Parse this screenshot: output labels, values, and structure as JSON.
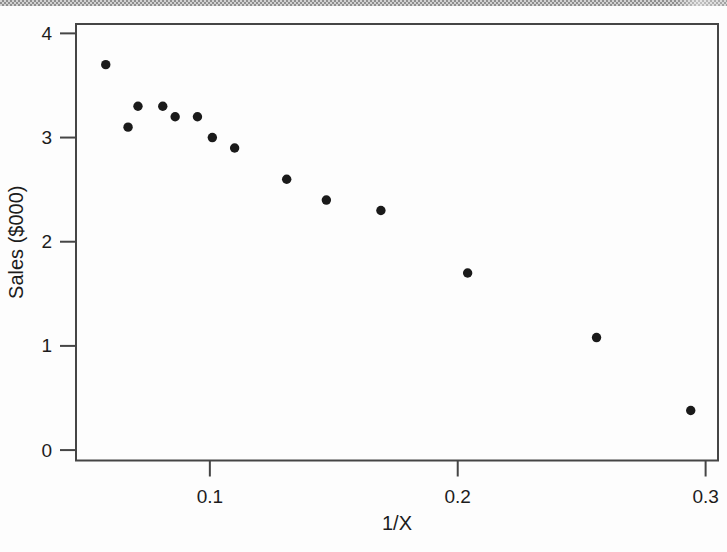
{
  "page": {
    "background_color": "#fdfdfd",
    "top_bar_color": "#a9a9a9"
  },
  "chart_data": {
    "type": "scatter",
    "title": "",
    "xlabel": "1/X",
    "ylabel": "Sales ($000)",
    "xlim": [
      0.046,
      0.305
    ],
    "ylim": [
      -0.1,
      4.09
    ],
    "grid": false,
    "legend": "none",
    "point_color": "#1a1a1a",
    "axis_color": "#454545",
    "text_color": "#1c1c1c",
    "x_ticks": [
      {
        "value": 0.1,
        "label": "0.1"
      },
      {
        "value": 0.2,
        "label": "0.2"
      },
      {
        "value": 0.3,
        "label": "0.3"
      }
    ],
    "y_ticks": [
      {
        "value": 0,
        "label": "0"
      },
      {
        "value": 1,
        "label": "1"
      },
      {
        "value": 2,
        "label": "2"
      },
      {
        "value": 3,
        "label": "3"
      },
      {
        "value": 4,
        "label": "4"
      }
    ],
    "points": [
      {
        "x": 0.058,
        "y": 3.7
      },
      {
        "x": 0.067,
        "y": 3.1
      },
      {
        "x": 0.071,
        "y": 3.3
      },
      {
        "x": 0.081,
        "y": 3.3
      },
      {
        "x": 0.086,
        "y": 3.2
      },
      {
        "x": 0.095,
        "y": 3.2
      },
      {
        "x": 0.101,
        "y": 3.0
      },
      {
        "x": 0.11,
        "y": 2.9
      },
      {
        "x": 0.131,
        "y": 2.6
      },
      {
        "x": 0.147,
        "y": 2.4
      },
      {
        "x": 0.169,
        "y": 2.3
      },
      {
        "x": 0.204,
        "y": 1.7
      },
      {
        "x": 0.256,
        "y": 1.08
      },
      {
        "x": 0.294,
        "y": 0.38
      }
    ]
  }
}
